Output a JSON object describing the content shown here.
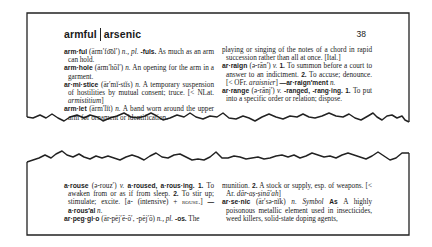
{
  "page": {
    "guide_words": {
      "first": "armful",
      "last": "arsenic"
    },
    "page_number": "38"
  },
  "top_section": {
    "left_column": [
      {
        "headword": "arm·ful",
        "pron": "(ärm′fo͝ol′)",
        "pos": "n.,",
        "extra_it": "pl.",
        "extra_b": "-fuls.",
        "def": "As much as an arm can hold."
      },
      {
        "headword": "arm·hole",
        "pron": "(ärm′hōl′)",
        "pos": "n.",
        "def": "An opening for the arm in a garment."
      },
      {
        "headword": "ar·mi·stice",
        "pron": "(är′mĭ-stĭs)",
        "pos": "n.",
        "def": "A temporary suspension of hostilities by mutual consent; truce. [< NLat.",
        "etym_it": "armistitium",
        "etym_end": "]"
      },
      {
        "headword": "arm·let",
        "pron": "(ärm′lĭt)",
        "pos": "n.",
        "def": "A band worn around the upper arm for ornament or identification."
      }
    ],
    "right_column": {
      "continuation": "playing or singing of the notes of a chord in rapid succession rather than all at once. [Ital.]",
      "entries": [
        {
          "headword": "ar·raign",
          "pron": "(ə-rān′)",
          "pos": "v.",
          "sense1_num": "1.",
          "sense1": "To summon before a court to answer to an indictment.",
          "sense2_num": "2.",
          "sense2": "To accuse; denounce. [< OFr.",
          "etym_it": "araisnier",
          "etym_end": "]",
          "derived": "—ar·raign′ment",
          "derived_pos": "n."
        },
        {
          "headword": "ar·range",
          "pron": "(ə-rānj′)",
          "pos": "v.",
          "inflections": "-ranged, -rang·ing.",
          "sense1_num": "1.",
          "sense1": "To put into a specific order or relation; dispose."
        }
      ]
    }
  },
  "bottom_section": {
    "left_column": [
      {
        "headword": "a·rouse",
        "pron": "(ə-rouz′)",
        "pos": "v.",
        "inflections": "a·roused, a·rous·ing.",
        "sense1_num": "1.",
        "sense1": "To awaken from or as if from sleep.",
        "sense2_num": "2.",
        "sense2": "To stir up; stimulate; excite. [a- (intensive) +",
        "etym_sc": "rouse",
        "etym_end": ".]",
        "derived": "—a·rous′al",
        "derived_pos": "n."
      },
      {
        "headword": "ar·peg·gi·o",
        "pron": "(är-pĕj′ē-ō′, -pĕj′ō)",
        "pos": "n.,",
        "extra_it": "pl.",
        "extra_b": "-os.",
        "def": "The"
      }
    ],
    "right_column": {
      "continuation_pre": "munition.",
      "continuation_num": "2.",
      "continuation": "A stock or supply, esp. of weapons. [< Ar.",
      "continuation_it": "dār-aṣ-ṣinā'ah",
      "continuation_end": "]",
      "entries": [
        {
          "headword": "ar·se·nic",
          "pron": "(är′sə-nĭk)",
          "pos": "n.",
          "symbol_label": "Symbol",
          "symbol": "As",
          "def": "A highly poisonous metallic element used in insecticides, weed killers, solid-state doping agents,"
        }
      ]
    }
  },
  "colors": {
    "ink": "#1a1a1a",
    "paper": "#ffffff"
  }
}
